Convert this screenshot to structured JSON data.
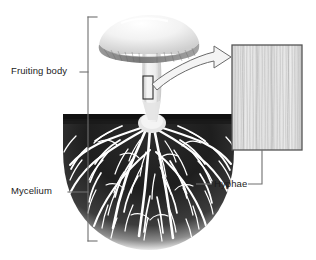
{
  "figure": {
    "background_color": "#ffffff",
    "line_color": "#4a4a4a",
    "text_color": "#1b1b1b"
  },
  "labels": {
    "fruiting_body": "Fruiting body",
    "mycelium": "Mycelium",
    "hyphae": "Hyphae"
  },
  "parts": {
    "cap": {
      "name": "mushroom-cap",
      "fill_light": "#f4f4f4",
      "fill_shadow": "#d8d8d8"
    },
    "gills": {
      "name": "mushroom-gills",
      "fill": "#8a8a8a"
    },
    "stalk": {
      "name": "mushroom-stalk",
      "fill": "#ededed"
    },
    "soil": {
      "name": "soil-mass",
      "fill_dark": "#1d1d1d",
      "fill_mid": "#6e6e6e"
    },
    "mycelium_threads": {
      "name": "mycelium-threads",
      "stroke": "#ffffff"
    },
    "inset": {
      "name": "hyphae-inset-panel",
      "border": "#555555",
      "fill": "#e2e2e2",
      "fiber_stroke": "#bdbdbd"
    },
    "callout_rect": {
      "name": "stalk-callout-rect",
      "border": "#3a3a3a"
    },
    "callout_arrow": {
      "name": "magnification-arrow",
      "border": "#6a6a6a",
      "fill": "#f2f2f2"
    },
    "bracket": {
      "name": "organism-bracket",
      "stroke": "#6f6f6f"
    }
  }
}
